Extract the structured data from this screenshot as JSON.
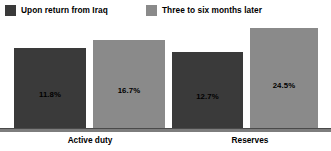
{
  "chart_data": {
    "type": "bar",
    "title": "",
    "xlabel": "",
    "ylabel": "",
    "grid": false,
    "legend_position": "top-left",
    "ylim": [
      0,
      28
    ],
    "categories": [
      "Active duty",
      "Reserves"
    ],
    "series": [
      {
        "name": "Upon return from Iraq",
        "color": "#3a3a3a",
        "values": [
          11.8,
          12.7
        ],
        "value_labels": [
          "11.8%",
          "12.7%"
        ]
      },
      {
        "name": "Three to six months later",
        "color": "#8a8a8a",
        "values": [
          16.7,
          24.5
        ],
        "value_labels": [
          "16.7%",
          "24.5%"
        ]
      }
    ]
  },
  "legend": {
    "items": [
      {
        "label": "Upon return from Iraq",
        "swatch_color": "#3a3a3a"
      },
      {
        "label": "Three to six months later",
        "swatch_color": "#8a8a8a"
      }
    ]
  },
  "bars": [
    {
      "label": "11.8%",
      "color": "#3a3a3a",
      "left": 14,
      "width": 72,
      "top": 26,
      "height": 81
    },
    {
      "label": "16.7%",
      "color": "#8a8a8a",
      "left": 93,
      "width": 72,
      "top": 18,
      "height": 89
    },
    {
      "label": "12.7%",
      "color": "#3a3a3a",
      "left": 172,
      "width": 71,
      "top": 30,
      "height": 77
    },
    {
      "label": "24.5%",
      "color": "#8a8a8a",
      "left": 250,
      "width": 68,
      "top": 6,
      "height": 101
    }
  ],
  "axis": {
    "baseline_color": "#7d7d7d",
    "baseline_edge_color": "#4a4a4a"
  },
  "category_labels": [
    {
      "text": "Active duty",
      "center": 90
    },
    {
      "text": "Reserves",
      "center": 250
    }
  ]
}
